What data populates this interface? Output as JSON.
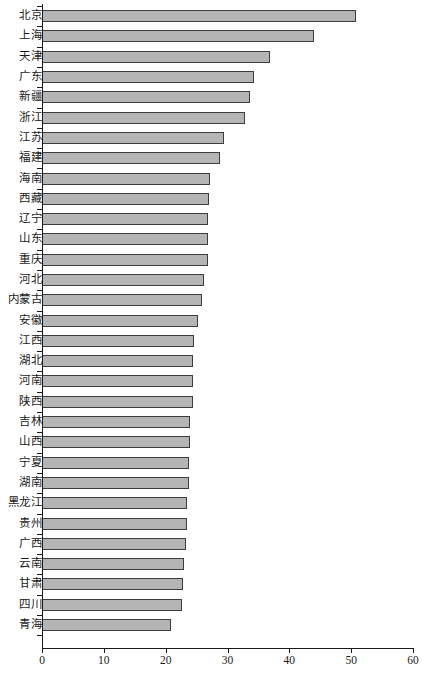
{
  "chart_data": {
    "type": "bar",
    "orientation": "horizontal",
    "title": "",
    "subtitle": "",
    "xlabel": "",
    "ylabel": "",
    "xlim": [
      0,
      60
    ],
    "ylim": null,
    "grid": false,
    "legend": null,
    "legend_position": "none",
    "xticks": [
      0,
      10,
      20,
      30,
      40,
      50,
      60
    ],
    "xtick_labels": [
      "0",
      "10",
      "20",
      "30",
      "40",
      "50",
      "60"
    ],
    "categories": [
      "北京",
      "上海",
      "天津",
      "广东",
      "新疆",
      "浙江",
      "江苏",
      "福建",
      "海南",
      "西藏",
      "辽宁",
      "山东",
      "重庆",
      "河北",
      "内蒙古",
      "安徽",
      "江西",
      "湖北",
      "河南",
      "陕西",
      "吉林",
      "山西",
      "宁夏",
      "湖南",
      "黑龙江",
      "贵州",
      "广西",
      "云南",
      "甘肃",
      "四川",
      "青海"
    ],
    "values": [
      50.8,
      44.0,
      36.9,
      34.3,
      33.6,
      32.8,
      29.5,
      28.8,
      27.2,
      27.0,
      26.9,
      26.9,
      26.9,
      26.2,
      25.8,
      25.2,
      24.6,
      24.5,
      24.4,
      24.4,
      24.0,
      23.9,
      23.8,
      23.7,
      23.5,
      23.4,
      23.3,
      22.9,
      22.8,
      22.6,
      20.8
    ],
    "bar_color": "#b5b5b5",
    "bar_edge_color": "#3d3d3d",
    "axis_color": "#1a1a1a"
  }
}
